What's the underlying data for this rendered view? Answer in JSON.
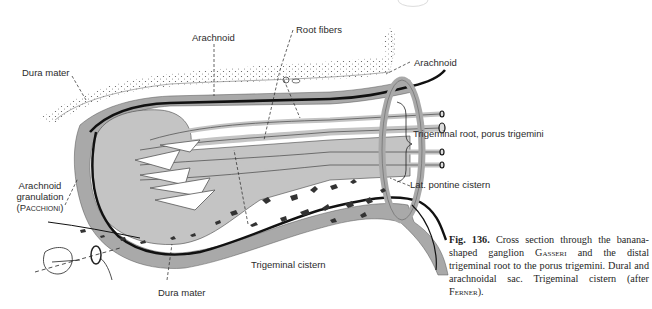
{
  "figure": {
    "number_label": "Fig. 136.",
    "caption_parts": {
      "p1": "Cross section through the banana-shaped ganglion ",
      "gasseri": "Gasseri",
      "p2": " and the distal trigeminal root to the porus trigemini. Dural and arachnoidal sac. Trigeminal cistern (after ",
      "ferner": "Ferner",
      "p3": ")."
    }
  },
  "labels": {
    "dura_mater_top": "Dura mater",
    "arachnoid_top": "Arachnoid",
    "root_fibers": "Root fibers",
    "arachnoid_right": "Arachnoid",
    "trigeminal_root": "Trigeminal root, porus trigemini",
    "lat_pontine_cistern": "Lat. pontine cistern",
    "arachnoid_granulation_line1": "Arachnoid",
    "arachnoid_granulation_line2": "granulation",
    "arachnoid_granulation_line3": "(Pacchioni)",
    "trigeminal_cistern": "Trigeminal cistern",
    "dura_mater_bottom": "Dura mater"
  },
  "colors": {
    "dura_gray": "#a9a9a9",
    "ganglion_gray": "#c4c4c4",
    "arachnoid_black": "#111111",
    "bone_stipple": "#444444",
    "text": "#2b2b2b"
  }
}
